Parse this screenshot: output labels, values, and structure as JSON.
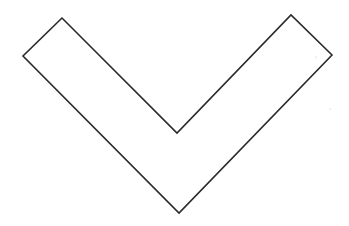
{
  "diagram": {
    "shape": "chevron-down-outline",
    "width": 349,
    "height": 226,
    "background": "#ffffff",
    "stroke_color": "#2a2a2a",
    "fill_color": "#ffffff",
    "stroke_width": 1.6,
    "vertices": [
      [
        62,
        18
      ],
      [
        23,
        56
      ],
      [
        179,
        213
      ],
      [
        332,
        55
      ],
      [
        291,
        15
      ],
      [
        177,
        133
      ]
    ],
    "specks": [
      [
        316,
        57
      ],
      [
        330,
        109
      ]
    ]
  }
}
